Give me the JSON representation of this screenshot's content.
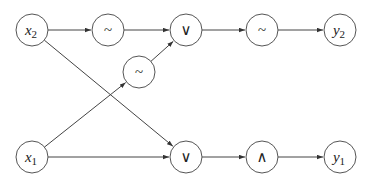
{
  "diagram": {
    "type": "circuit-graph",
    "nodes": [
      {
        "id": "x2",
        "label": "x",
        "sub": "2",
        "kind": "input",
        "cx": 32,
        "cy": 30
      },
      {
        "id": "n_tilde_top",
        "label": "~",
        "kind": "op",
        "cx": 108,
        "cy": 30
      },
      {
        "id": "n_or_top",
        "label": "∨",
        "kind": "op",
        "cx": 186,
        "cy": 30
      },
      {
        "id": "n_tilde_right",
        "label": "~",
        "kind": "op",
        "cx": 262,
        "cy": 30
      },
      {
        "id": "y2",
        "label": "y",
        "sub": "2",
        "kind": "output",
        "cx": 340,
        "cy": 30
      },
      {
        "id": "n_tilde_mid",
        "label": "~",
        "kind": "op",
        "cx": 139,
        "cy": 72
      },
      {
        "id": "x1",
        "label": "x",
        "sub": "1",
        "kind": "input",
        "cx": 32,
        "cy": 157
      },
      {
        "id": "n_or_bottom",
        "label": "∨",
        "kind": "op",
        "cx": 186,
        "cy": 157
      },
      {
        "id": "n_and_bottom",
        "label": "∧",
        "kind": "op",
        "cx": 262,
        "cy": 157
      },
      {
        "id": "y1",
        "label": "y",
        "sub": "1",
        "kind": "output",
        "cx": 340,
        "cy": 157
      }
    ],
    "edges": [
      {
        "from": "x2",
        "to": "n_tilde_top"
      },
      {
        "from": "n_tilde_top",
        "to": "n_or_top"
      },
      {
        "from": "n_or_top",
        "to": "n_tilde_right"
      },
      {
        "from": "n_tilde_right",
        "to": "y2"
      },
      {
        "from": "n_tilde_mid",
        "to": "n_or_top"
      },
      {
        "from": "x1",
        "to": "n_tilde_mid"
      },
      {
        "from": "x2",
        "to": "n_or_bottom"
      },
      {
        "from": "x1",
        "to": "n_or_bottom"
      },
      {
        "from": "n_or_bottom",
        "to": "n_and_bottom"
      },
      {
        "from": "n_and_bottom",
        "to": "y1"
      }
    ],
    "node_radius": 16,
    "colors": {
      "stroke": "#555555",
      "edge": "#444444",
      "background": "#ffffff"
    }
  }
}
